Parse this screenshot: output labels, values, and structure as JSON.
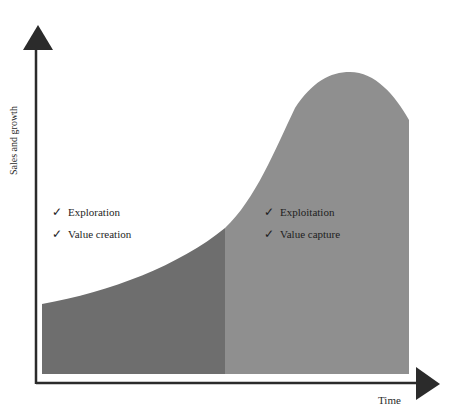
{
  "diagram": {
    "y_axis_label": "Sales and growth",
    "x_axis_label": "Time",
    "colors": {
      "axis": "#2b2b2b",
      "early_phase_fill": "#6e6e6e",
      "late_phase_fill": "#8f8f8f",
      "background": "#ffffff"
    },
    "left_phase": {
      "items": [
        {
          "icon": "checkmark-icon",
          "glyph": "✓",
          "label": "Exploration"
        },
        {
          "icon": "checkmark-icon",
          "glyph": "✓",
          "label": "Value creation"
        }
      ]
    },
    "right_phase": {
      "items": [
        {
          "icon": "checkmark-icon",
          "glyph": "✓",
          "label": "Exploitation"
        },
        {
          "icon": "checkmark-icon",
          "glyph": "✓",
          "label": "Value capture"
        }
      ]
    }
  }
}
